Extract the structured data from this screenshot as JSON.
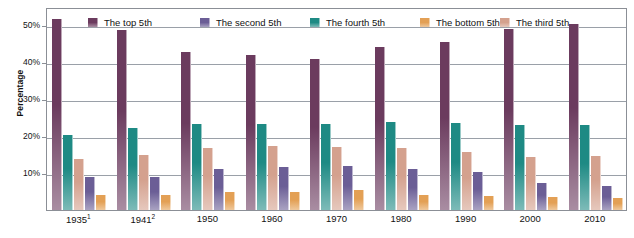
{
  "chart_data": {
    "type": "bar",
    "title": "",
    "xlabel": "",
    "ylabel": "Percentage",
    "ylim": [
      0,
      55
    ],
    "grid": true,
    "legend_position": "top-inside",
    "categories": [
      "1935¹",
      "1941²",
      "1950",
      "1960",
      "1970",
      "1980",
      "1990",
      "2000",
      "2010"
    ],
    "ytick_labels": [
      "10%",
      "20%",
      "30%",
      "40%",
      "50%"
    ],
    "ytick_values": [
      10,
      20,
      30,
      40,
      50
    ],
    "series": [
      {
        "name": "The top 5th",
        "color": "#6B3B5E",
        "values": [
          51.7,
          48.8,
          42.7,
          42.0,
          40.9,
          44.1,
          45.4,
          49.1,
          50.3
        ]
      },
      {
        "name": "The fourth 5th",
        "color": "#1E8A84",
        "values": [
          20.4,
          22.2,
          23.2,
          23.4,
          23.2,
          23.9,
          23.6,
          22.9,
          23.0
        ]
      },
      {
        "name": "The third 5th",
        "color": "#D4A18E",
        "values": [
          13.8,
          15.0,
          16.9,
          17.3,
          17.0,
          16.8,
          15.8,
          14.4,
          14.6
        ]
      },
      {
        "name": "The second 5th",
        "color": "#6B5E96",
        "values": [
          9.0,
          9.0,
          11.0,
          11.6,
          12.0,
          11.0,
          10.2,
          7.3,
          6.5
        ]
      },
      {
        "name": "The bottom 5th",
        "color": "#E3A055",
        "values": [
          4.1,
          4.1,
          5.0,
          4.8,
          5.4,
          4.2,
          3.9,
          3.4,
          3.3
        ]
      }
    ]
  },
  "legend": {
    "items": [
      {
        "label": "The top 5th"
      },
      {
        "label": "The second 5th"
      },
      {
        "label": "The fourth 5th"
      },
      {
        "label": "The bottom 5th"
      },
      {
        "label": "The third 5th"
      }
    ]
  },
  "axes": {
    "y_title": "Percentage"
  }
}
